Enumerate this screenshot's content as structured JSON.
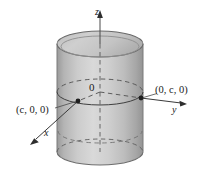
{
  "figure": {
    "kind": "3d-cylinder-coordinate-diagram",
    "background_color": "#ffffff",
    "axes": [
      {
        "id": "z",
        "label": "z",
        "direction": "up",
        "arrow": true
      },
      {
        "id": "y",
        "label": "y",
        "direction": "right",
        "arrow": true
      },
      {
        "id": "x",
        "label": "x",
        "direction": "down-left",
        "arrow": true
      }
    ],
    "origin": {
      "label": "0"
    },
    "points": [
      {
        "id": "point-c00",
        "label": "(c, 0, 0)",
        "on_axis": "x"
      },
      {
        "id": "point-0c0",
        "label": "(0, c, 0)",
        "on_axis": "y"
      }
    ],
    "solid": {
      "name": "cylinder",
      "fill_light": "#d8d8d8",
      "fill_mid": "#b9b9b9",
      "fill_dark": "#8f8f8f",
      "top_cap_fill": "#c9c9c9",
      "outline_color": "#5c5c5c",
      "hidden_line_style": "dashed"
    },
    "line_color": "#3a3a3a",
    "text_color": "#1a1a1a"
  }
}
